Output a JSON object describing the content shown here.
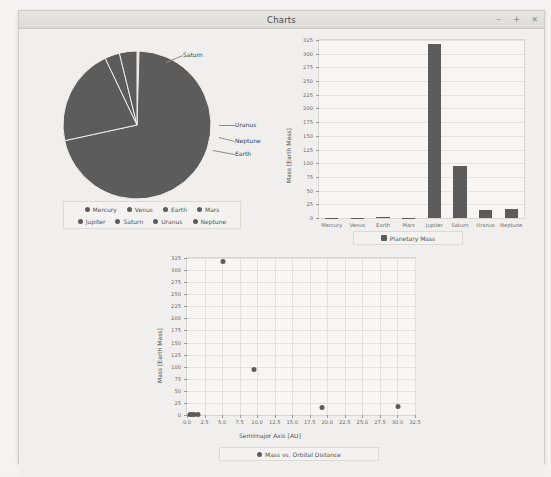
{
  "window": {
    "title": "Charts",
    "buttons": [
      {
        "name": "minimize",
        "glyph": "–"
      },
      {
        "name": "maximize",
        "glyph": "+"
      },
      {
        "name": "close",
        "glyph": "✕"
      }
    ]
  },
  "colors": {
    "series": "#5c5c5c",
    "plot_background": "#f7f6f5",
    "grid": "#e3e1de",
    "window_background": "#eceae7"
  },
  "chart_data": [
    {
      "id": "pie",
      "type": "pie",
      "title": "",
      "categories": [
        "Mercury",
        "Venus",
        "Earth",
        "Mars",
        "Jupiter",
        "Saturn",
        "Uranus",
        "Neptune"
      ],
      "values": [
        0.055,
        0.815,
        1.0,
        0.107,
        317.8,
        95.2,
        14.5,
        17.1
      ],
      "unit": "Earth Mass",
      "visible_slice_labels": [
        "Saturn",
        "Uranus",
        "Neptune",
        "Earth",
        "Jupiter"
      ],
      "legend": {
        "position": "bottom",
        "entries": [
          "Mercury",
          "Venus",
          "Earth",
          "Mars",
          "Jupiter",
          "Saturn",
          "Uranus",
          "Neptune"
        ]
      }
    },
    {
      "id": "bar",
      "type": "bar",
      "title": "",
      "categories": [
        "Mercury",
        "Venus",
        "Earth",
        "Mars",
        "Jupiter",
        "Saturn",
        "Uranus",
        "Neptune"
      ],
      "values": [
        0.055,
        0.815,
        1.0,
        0.107,
        317.8,
        95.2,
        14.5,
        17.1
      ],
      "xlabel": "",
      "ylabel": "Mass [Earth Mass]",
      "ylim": [
        0,
        325
      ],
      "yticks": [
        0,
        25,
        50,
        75,
        100,
        125,
        150,
        175,
        200,
        225,
        250,
        275,
        300,
        325
      ],
      "grid": true,
      "legend": {
        "position": "bottom",
        "entries": [
          "Planetary Mass"
        ]
      }
    },
    {
      "id": "scatter",
      "type": "scatter",
      "title": "",
      "xlabel": "Semimajor Axis [AU]",
      "ylabel": "Mass [Earth Mass]",
      "xlim": [
        0,
        32.5
      ],
      "ylim": [
        0,
        325
      ],
      "xticks": [
        0.0,
        2.5,
        5.0,
        7.5,
        10.0,
        12.5,
        15.0,
        17.5,
        20.0,
        22.5,
        25.0,
        27.5,
        30.0,
        32.5
      ],
      "yticks": [
        0,
        25,
        50,
        75,
        100,
        125,
        150,
        175,
        200,
        225,
        250,
        275,
        300,
        325
      ],
      "grid": true,
      "points": [
        {
          "label": "Mercury",
          "x": 0.39,
          "y": 0.055
        },
        {
          "label": "Venus",
          "x": 0.72,
          "y": 0.815
        },
        {
          "label": "Earth",
          "x": 1.0,
          "y": 1.0
        },
        {
          "label": "Mars",
          "x": 1.52,
          "y": 0.107
        },
        {
          "label": "Jupiter",
          "x": 5.2,
          "y": 317.8
        },
        {
          "label": "Saturn",
          "x": 9.58,
          "y": 95.2
        },
        {
          "label": "Uranus",
          "x": 19.2,
          "y": 14.5
        },
        {
          "label": "Neptune",
          "x": 30.05,
          "y": 17.1
        }
      ],
      "legend": {
        "position": "bottom",
        "entries": [
          "Mass vs. Orbital Distance"
        ]
      }
    }
  ]
}
